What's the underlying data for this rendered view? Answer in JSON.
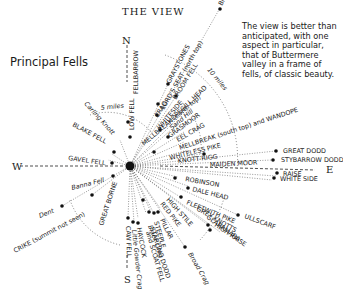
{
  "title": "THE VIEW",
  "subtitle": "Principal Fells",
  "note": "The view is better than anticipated, with one aspect in particular, that of Buttermere valley in a frame of fells, of classic beauty.",
  "compass": {
    "north": "N",
    "south": "S",
    "east": "E",
    "west": "W"
  },
  "distance_rings": [
    {
      "label": "5 miles"
    },
    {
      "label": "10 miles"
    }
  ],
  "fells": [
    {
      "name": "FELLBARROW",
      "angle": -90,
      "dist": 52
    },
    {
      "name": "LOW FELL",
      "angle": -88,
      "dist": 30
    },
    {
      "name": "BINSEY",
      "angle": -58,
      "dist": 118
    },
    {
      "name": "GRAYSTONES",
      "angle": -62,
      "dist": 62
    },
    {
      "name": "BROOM FELL",
      "angle": -58,
      "dist": 66
    },
    {
      "name": "LORD'S SEAT (north top)",
      "angle": -62,
      "dist": 40
    },
    {
      "name": "CRAG",
      "angle": -58,
      "dist": 32
    },
    {
      "name": "HOPEGILL HEAD",
      "angle": -44,
      "dist": 46
    },
    {
      "name": "WHITESIDE",
      "angle": -50,
      "dist": 30
    },
    {
      "name": "Sand Hill",
      "angle": -40,
      "dist": 40
    },
    {
      "name": "GRASMOOR",
      "angle": -36,
      "dist": 28
    },
    {
      "name": "EEL CRAG",
      "angle": -30,
      "dist": 32
    },
    {
      "name": "MELLBREAK (north top)",
      "angle": -40,
      "dist": 18
    },
    {
      "name": "MELLBREAK (south top) and WANDOPE",
      "angle": -24,
      "dist": 36
    },
    {
      "name": "WHITELESS PIKE",
      "angle": -14,
      "dist": 28
    },
    {
      "name": "KNOTT RIGG",
      "angle": -8,
      "dist": 32
    },
    {
      "name": "MAIDEN MOOR",
      "angle": -2,
      "dist": 60
    },
    {
      "name": "GREAT DODD",
      "angle": -10,
      "dist": 175
    },
    {
      "name": "STYBARROW DODD",
      "angle": -5,
      "dist": 170
    },
    {
      "name": "RAISE",
      "angle": 6,
      "dist": 162
    },
    {
      "name": "WHITE SIDE",
      "angle": 9,
      "dist": 158
    },
    {
      "name": "ROBINSON",
      "angle": 14,
      "dist": 44
    },
    {
      "name": "DALE HEAD",
      "angle": 22,
      "dist": 52
    },
    {
      "name": "FLEETWITH PIKE",
      "angle": 34,
      "dist": 56
    },
    {
      "name": "ULLSCARF",
      "angle": 24,
      "dist": 110
    },
    {
      "name": "HIGH RAISE",
      "angle": 34,
      "dist": 86
    },
    {
      "name": "GREY KNOTTS",
      "angle": 40,
      "dist": 58
    },
    {
      "name": "GLARAMARA",
      "angle": 42,
      "dist": 70
    },
    {
      "name": "HIGH STILE",
      "angle": 50,
      "dist": 36
    },
    {
      "name": "RED PIKE",
      "angle": 54,
      "dist": 32
    },
    {
      "name": "Broad Crag",
      "angle": 58,
      "dist": 84
    },
    {
      "name": "PILLAR",
      "angle": 64,
      "dist": 40
    },
    {
      "name": "Black Crag",
      "angle": 70,
      "dist": 40
    },
    {
      "name": "STEEPLE",
      "angle": 74,
      "dist": 38
    },
    {
      "name": "HAYCOCK",
      "angle": 80,
      "dist": 44
    },
    {
      "name": "STARLING DODD",
      "angle": 72,
      "dist": 42
    },
    {
      "name": "GREAT BORNE",
      "angle": 100,
      "dist": 40
    },
    {
      "name": "and SCOAT FELL",
      "angle": 74,
      "dist": 44
    },
    {
      "name": "Little Gowder Crag",
      "angle": 84,
      "dist": 48
    },
    {
      "name": "CAW FELL",
      "angle": 88,
      "dist": 48
    },
    {
      "name": "Banna Fell",
      "angle": 160,
      "dist": 30
    },
    {
      "name": "GAVEL FELL",
      "angle": 172,
      "dist": 38
    },
    {
      "name": "BLAKE FELL",
      "angle": -150,
      "dist": 54
    },
    {
      "name": "Carling Knott",
      "angle": -136,
      "dist": 44
    },
    {
      "name": "Dent",
      "angle": 150,
      "dist": 100
    },
    {
      "name": "CRIKE (summit not seen)",
      "angle": 148,
      "dist": 108
    }
  ]
}
